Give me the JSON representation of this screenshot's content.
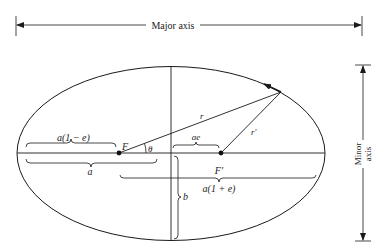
{
  "diagram": {
    "major_axis_label": "Major axis",
    "minor_axis_label_line1": "Minor",
    "minor_axis_label_line2": "axis",
    "labels": {
      "focus": "F",
      "other_focus": "F′",
      "theta": "θ",
      "r": "r",
      "r_prime": "r′",
      "a_one_minus_e": "a(1 − e)",
      "a": "a",
      "ae": "ae",
      "a_one_plus_e": "a(1 + e)",
      "b": "b"
    }
  }
}
